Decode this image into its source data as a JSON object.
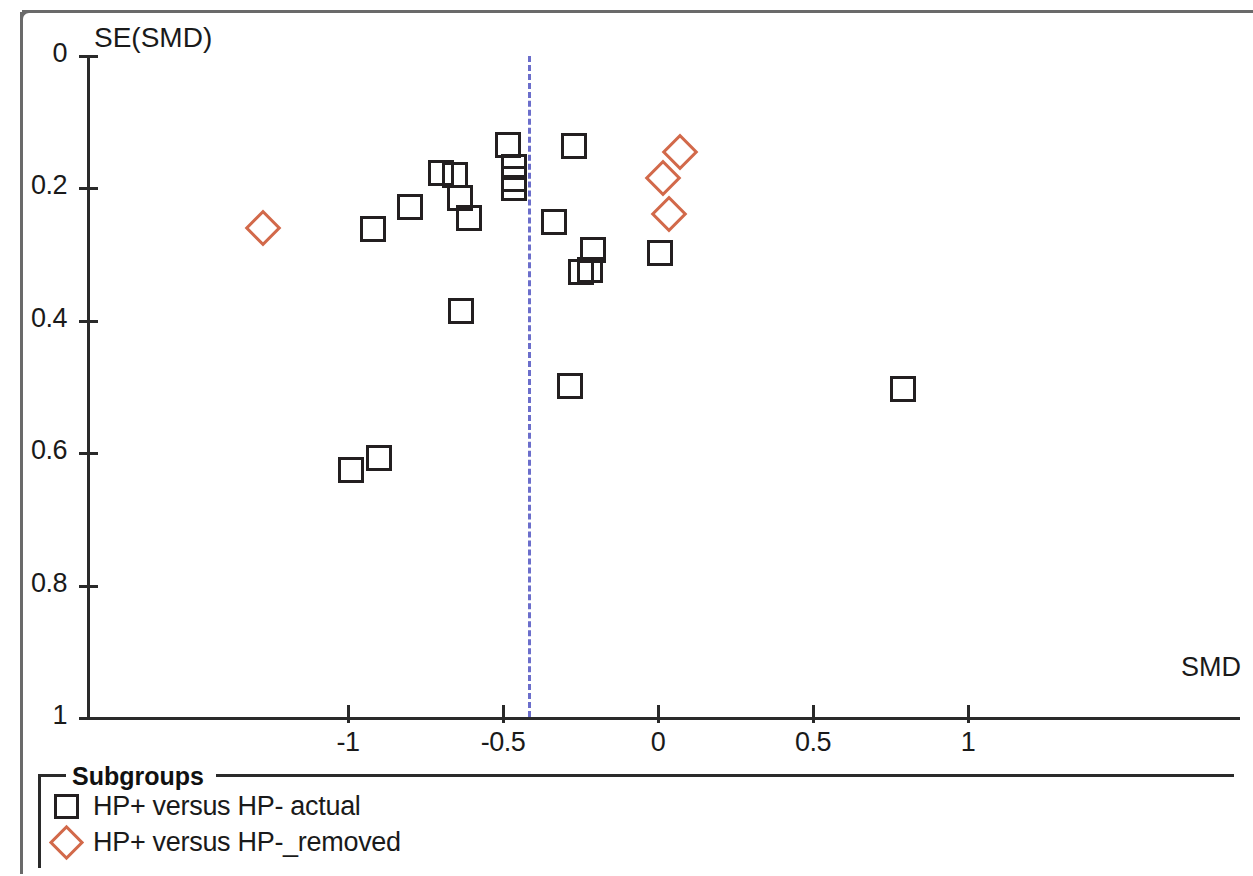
{
  "chart_data": {
    "type": "scatter",
    "title": "",
    "xlabel": "SMD",
    "ylabel": "SE(SMD)",
    "xlim": [
      -1.45,
      1.4
    ],
    "ylim": [
      0,
      1
    ],
    "y_axis_inverted": true,
    "grid": false,
    "xticks": [
      -1,
      -0.5,
      0,
      0.5,
      1
    ],
    "xtick_labels": [
      "-1",
      "-0.5",
      "0",
      "0.5",
      "1"
    ],
    "yticks": [
      0,
      0.2,
      0.4,
      0.6,
      0.8,
      1
    ],
    "ytick_labels": [
      "0",
      "0.2",
      "0.4",
      "0.6",
      "0.8",
      "1"
    ],
    "reference_line": {
      "x": -0.42,
      "style": "dashed",
      "color": "#6b6ecb",
      "orientation": "vertical"
    },
    "legend": {
      "title": "Subgroups",
      "position": "below-plot"
    },
    "series": [
      {
        "name": "HP+ versus HP- actual",
        "marker": "square",
        "color": "#231f20",
        "points": [
          {
            "x": -0.99,
            "y": 0.625
          },
          {
            "x": -0.9,
            "y": 0.608
          },
          {
            "x": -0.92,
            "y": 0.262
          },
          {
            "x": -0.8,
            "y": 0.228
          },
          {
            "x": -0.7,
            "y": 0.177
          },
          {
            "x": -0.655,
            "y": 0.18
          },
          {
            "x": -0.64,
            "y": 0.215
          },
          {
            "x": -0.635,
            "y": 0.385
          },
          {
            "x": -0.61,
            "y": 0.245
          },
          {
            "x": -0.485,
            "y": 0.135
          },
          {
            "x": -0.465,
            "y": 0.168
          },
          {
            "x": -0.465,
            "y": 0.186
          },
          {
            "x": -0.465,
            "y": 0.2
          },
          {
            "x": -0.27,
            "y": 0.136
          },
          {
            "x": -0.335,
            "y": 0.251
          },
          {
            "x": -0.21,
            "y": 0.293
          },
          {
            "x": -0.25,
            "y": 0.327
          },
          {
            "x": -0.22,
            "y": 0.323
          },
          {
            "x": -0.285,
            "y": 0.499
          },
          {
            "x": 0.005,
            "y": 0.298
          },
          {
            "x": 0.79,
            "y": 0.503
          }
        ]
      },
      {
        "name": "HP+ versus HP-_removed",
        "marker": "diamond",
        "color": "#d2694a",
        "points": [
          {
            "x": -1.275,
            "y": 0.26
          },
          {
            "x": 0.07,
            "y": 0.145
          },
          {
            "x": 0.015,
            "y": 0.184
          },
          {
            "x": 0.035,
            "y": 0.239
          }
        ]
      }
    ]
  },
  "axes": {
    "ylabel": "SE(SMD)",
    "xlabel": "SMD"
  },
  "legend": {
    "title": "Subgroups",
    "entries": [
      {
        "label": "HP+ versus HP- actual",
        "marker": "square-icon",
        "color": "#231f20"
      },
      {
        "label": "HP+ versus HP-_removed",
        "marker": "diamond-icon",
        "color": "#d2694a"
      }
    ]
  }
}
